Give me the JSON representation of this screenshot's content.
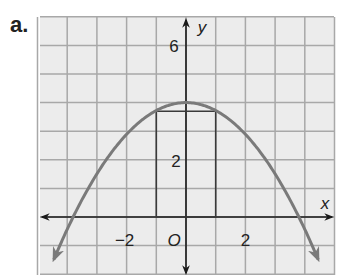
{
  "problem_label": "a.",
  "colors": {
    "grid_bg": "#ececec",
    "grid_line": "#a8a8a8",
    "axis": "#1a1a1a",
    "curve": "#7a7a7a",
    "rectangle": "#3a3a3a"
  },
  "axes": {
    "x_name": "x",
    "y_name": "y",
    "origin_label": "O",
    "x_tick_labels": [
      "−2",
      "2"
    ],
    "y_tick_labels": [
      "2",
      "6"
    ]
  },
  "chart_data": {
    "type": "line",
    "title": "",
    "xlabel": "x",
    "ylabel": "y",
    "xlim": [
      -5,
      5
    ],
    "ylim": [
      -2,
      7
    ],
    "grid": true,
    "grid_step": 1,
    "tick_labels": {
      "x": [
        -2,
        2
      ],
      "y": [
        2,
        6
      ]
    },
    "series": [
      {
        "name": "parabola",
        "equation_approx": "y = 4 - 0.28x^2",
        "vertex": [
          0,
          4
        ],
        "x_intercepts": [
          -3.8,
          3.8
        ],
        "x": [
          -4.4,
          -3.8,
          -3,
          -2,
          -1,
          0,
          1,
          2,
          3,
          3.8,
          4.4
        ],
        "y": [
          -1.4,
          0,
          1.5,
          2.9,
          3.7,
          4,
          3.7,
          2.9,
          1.5,
          0,
          -1.4
        ],
        "arrows_at_ends": true
      },
      {
        "name": "inscribed-rectangle",
        "corners": [
          [
            -1,
            0
          ],
          [
            1,
            0
          ],
          [
            1,
            3.7
          ],
          [
            -1,
            3.7
          ]
        ]
      }
    ]
  }
}
